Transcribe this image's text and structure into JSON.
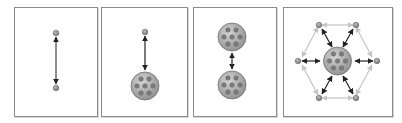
{
  "diagram": {
    "colors": {
      "panel_border": "#8a8a8a",
      "node_fill": "#9a9a9a",
      "node_stroke": "#6a6a6a",
      "cluster_fill": "#b0b0b0",
      "cluster_stroke": "#707070",
      "inner_dot": "#7c7c7c",
      "arrow_dark": "#222222",
      "arrow_light": "#c4c4c4"
    },
    "panels": [
      {
        "id": "panel-1",
        "label": "node-to-node",
        "x": 14,
        "y": 7,
        "w": 82,
        "h": 108
      },
      {
        "id": "panel-2",
        "label": "node-to-cluster",
        "x": 101,
        "y": 7,
        "w": 85,
        "h": 108
      },
      {
        "id": "panel-3",
        "label": "cluster-to-cluster",
        "x": 193,
        "y": 7,
        "w": 82,
        "h": 108
      },
      {
        "id": "panel-4",
        "label": "cluster-with-hexagon-neighbors",
        "x": 283,
        "y": 7,
        "w": 108,
        "h": 108
      }
    ]
  }
}
